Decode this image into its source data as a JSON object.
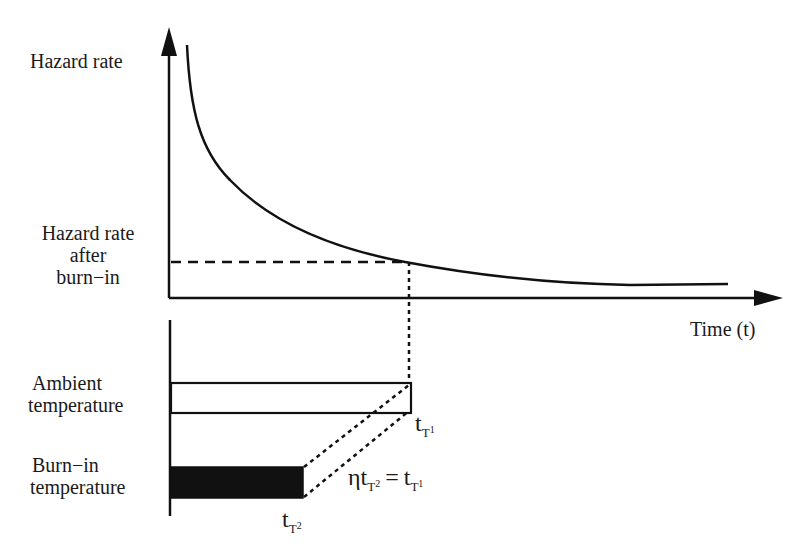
{
  "diagram": {
    "upper_plot": {
      "y_axis_label": "Hazard rate",
      "y_marker_label_lines": [
        "Hazard rate",
        "after",
        "burn−in"
      ],
      "x_axis_label": "Time (t)",
      "curve": "decreasing hazard rate (infant mortality)"
    },
    "lower_plot": {
      "bars": [
        {
          "label_lines": [
            "Ambient",
            "temperature"
          ],
          "fill": "#ffffff",
          "end_label": {
            "base": "t",
            "sub": "T",
            "subsub": "1"
          }
        },
        {
          "label_lines": [
            "Burn−in",
            "temperature"
          ],
          "fill": "#111111",
          "end_label": {
            "base": "t",
            "sub": "T",
            "subsub": "2"
          }
        }
      ],
      "equation": {
        "eta": "η",
        "lhs_base": "t",
        "lhs_sub": "T",
        "lhs_subsub": "2",
        "equals": "=",
        "rhs_base": "t",
        "rhs_sub": "T",
        "rhs_subsub": "1"
      }
    },
    "colors": {
      "ink": "#111111",
      "background": "#ffffff"
    }
  }
}
